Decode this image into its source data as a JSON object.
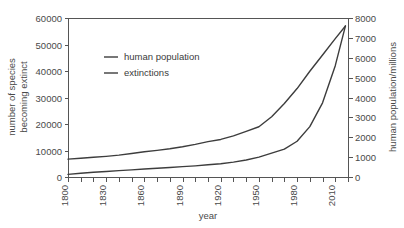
{
  "chart_data": {
    "type": "line",
    "title": "",
    "xlabel": "year",
    "ylabel": "number of species becoming extinct",
    "y2label": "human population/millions",
    "grid": false,
    "legend_position": "upper-left-inside",
    "xlim": [
      1800,
      2020
    ],
    "ylim": [
      0,
      60000
    ],
    "y2lim": [
      0,
      8000
    ],
    "x_major_ticks": [
      1800,
      1830,
      1860,
      1890,
      1920,
      1950,
      1980,
      2010
    ],
    "x_minor_step": 10,
    "y_ticks": [
      0,
      10000,
      20000,
      30000,
      40000,
      50000,
      60000
    ],
    "y2_ticks": [
      0,
      1000,
      2000,
      3000,
      4000,
      5000,
      6000,
      7000,
      8000
    ],
    "x_tick_labels": [
      "1800",
      "1830",
      "1860",
      "1890",
      "1920",
      "1950",
      "1980",
      "2010"
    ],
    "y_tick_labels": [
      "0",
      "10000",
      "20000",
      "30000",
      "40000",
      "50000",
      "60000"
    ],
    "y2_tick_labels": [
      "0",
      "1000",
      "2000",
      "3000",
      "4000",
      "5000",
      "6000",
      "7000",
      "8000"
    ],
    "series": [
      {
        "name": "human population",
        "axis": "right",
        "units": "millions",
        "x": [
          1800,
          1810,
          1820,
          1830,
          1840,
          1850,
          1860,
          1870,
          1880,
          1890,
          1900,
          1910,
          1920,
          1930,
          1940,
          1950,
          1960,
          1970,
          1980,
          1990,
          2000,
          2010,
          2018
        ],
        "values": [
          900,
          940,
          990,
          1040,
          1100,
          1180,
          1270,
          1340,
          1420,
          1520,
          1640,
          1780,
          1890,
          2070,
          2300,
          2530,
          3030,
          3700,
          4450,
          5320,
          6140,
          6960,
          7600
        ]
      },
      {
        "name": "extinctions",
        "axis": "left",
        "units": "species",
        "x": [
          1800,
          1810,
          1820,
          1830,
          1840,
          1850,
          1860,
          1870,
          1880,
          1890,
          1900,
          1910,
          1920,
          1930,
          1940,
          1950,
          1960,
          1970,
          1980,
          1990,
          2000,
          2010,
          2018
        ],
        "values": [
          1000,
          1400,
          1800,
          2100,
          2400,
          2700,
          3000,
          3300,
          3600,
          3900,
          4200,
          4600,
          5000,
          5600,
          6400,
          7500,
          9000,
          10500,
          13500,
          19000,
          28000,
          42000,
          57000
        ]
      }
    ],
    "legend_entries": [
      "human population",
      "extinctions"
    ],
    "line_color": "#3d3d3d",
    "axis_color": "#555555",
    "background_color": "#ffffff"
  }
}
